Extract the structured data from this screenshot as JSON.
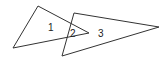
{
  "diagram": {
    "type": "overlapping-triangles",
    "stroke_color": "#333333",
    "background": "#ffffff",
    "shapes": [
      {
        "name": "triangle-left",
        "points": [
          [
            38,
            6
          ],
          [
            13,
            48
          ],
          [
            89,
            33
          ]
        ]
      },
      {
        "name": "triangle-right",
        "points": [
          [
            74,
            13
          ],
          [
            62,
            56
          ],
          [
            159,
            27
          ]
        ]
      }
    ],
    "regions": [
      {
        "label": "1",
        "x": 48,
        "y": 31
      },
      {
        "label": "2",
        "x": 70,
        "y": 37
      },
      {
        "label": "3",
        "x": 98,
        "y": 37
      }
    ]
  }
}
